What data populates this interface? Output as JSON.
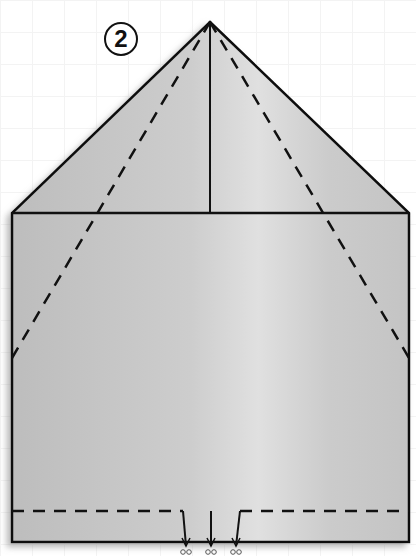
{
  "diagram": {
    "step_number": "2",
    "colors": {
      "paper": "#c9c9c9",
      "paper_highlight": "#e2e2e2",
      "line": "#111111",
      "background": "#ffffff"
    },
    "shape": {
      "apex": [
        210,
        22
      ],
      "left_corner": [
        12,
        213
      ],
      "right_corner": [
        409,
        213
      ],
      "bottom_left": [
        12,
        542
      ],
      "bottom_right": [
        409,
        542
      ]
    },
    "lines": {
      "solid": [
        "outline",
        "horizontal-fold-edge",
        "vertical-center-line"
      ],
      "dashed": [
        "left-diagonal-fold",
        "right-diagonal-fold",
        "bottom-fold-line"
      ]
    },
    "cut_marks": {
      "count": 3,
      "x_positions": [
        185,
        211,
        237
      ],
      "icon": "scissors"
    }
  }
}
